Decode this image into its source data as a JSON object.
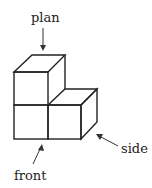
{
  "diagram": {
    "type": "isometric-block-views",
    "labels": {
      "plan": "plan",
      "front": "front",
      "side": "side"
    },
    "colors": {
      "line": "#222222",
      "background": "#ffffff"
    },
    "structure": {
      "description": "Three unit cubes forming an L shape: two stacked on the left, one to the right on the bottom row",
      "cubes": 3
    }
  }
}
